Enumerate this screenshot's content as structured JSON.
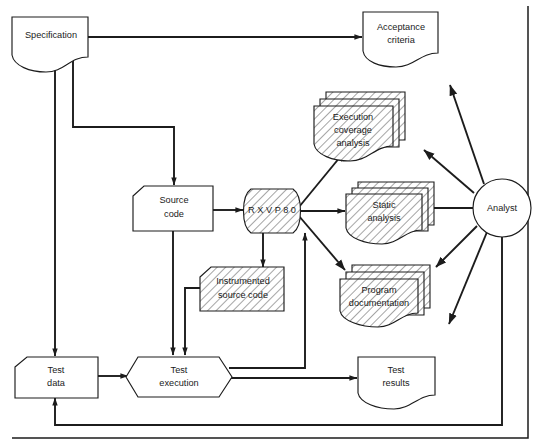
{
  "diagram": {
    "colors": {
      "stroke": "#1c1c1c",
      "background": "#ffffff",
      "hatch": "#2a2a2a"
    },
    "nodes": [
      {
        "id": "specification",
        "label": "Specification",
        "label_lines": [
          "Specification"
        ],
        "shape": "document",
        "hatched": false
      },
      {
        "id": "acceptance-criteria",
        "label": "Acceptance criteria",
        "label_lines": [
          "Acceptance",
          "criteria"
        ],
        "shape": "document",
        "hatched": false
      },
      {
        "id": "source-code",
        "label": "Source code",
        "label_lines": [
          "Source",
          "code"
        ],
        "shape": "notched-card",
        "hatched": false
      },
      {
        "id": "rxvp80",
        "label": "RXVP80",
        "label_lines": [
          "R X V P 8 0"
        ],
        "shape": "drum",
        "hatched": true
      },
      {
        "id": "execution-coverage-analysis",
        "label": "Execution coverage analysis",
        "label_lines": [
          "Execution",
          "coverage",
          "analysis"
        ],
        "shape": "document-stack",
        "hatched": true
      },
      {
        "id": "static-analysis",
        "label": "Static analysis",
        "label_lines": [
          "Static",
          "analysis"
        ],
        "shape": "document-stack",
        "hatched": true
      },
      {
        "id": "program-documentation",
        "label": "Program documentation",
        "label_lines": [
          "Program",
          "documentation"
        ],
        "shape": "document-stack",
        "hatched": true
      },
      {
        "id": "instrumented-source-code",
        "label": "Instrumented source code",
        "label_lines": [
          "Instrumented",
          "source code"
        ],
        "shape": "notched-card",
        "hatched": true
      },
      {
        "id": "test-data",
        "label": "Test data",
        "label_lines": [
          "Test",
          "data"
        ],
        "shape": "notched-card",
        "hatched": false
      },
      {
        "id": "test-execution",
        "label": "Test execution",
        "label_lines": [
          "Test",
          "execution"
        ],
        "shape": "hexagon",
        "hatched": false
      },
      {
        "id": "test-results",
        "label": "Test results",
        "label_lines": [
          "Test",
          "results"
        ],
        "shape": "document",
        "hatched": false
      },
      {
        "id": "analyst",
        "label": "Analyst",
        "label_lines": [
          "Analyst"
        ],
        "shape": "circle",
        "hatched": false
      }
    ],
    "edges": [
      {
        "id": "spec-to-acceptance",
        "from": "specification",
        "to": "acceptance-criteria",
        "arrow": true
      },
      {
        "id": "spec-to-source-code",
        "from": "specification",
        "to": "source-code",
        "arrow": true
      },
      {
        "id": "spec-to-test-data",
        "from": "specification",
        "to": "test-data",
        "arrow": true
      },
      {
        "id": "source-code-to-rxvp80",
        "from": "source-code",
        "to": "rxvp80",
        "arrow": true
      },
      {
        "id": "source-code-to-test-execution",
        "from": "source-code",
        "to": "test-execution",
        "arrow": true
      },
      {
        "id": "rxvp80-to-instrumented",
        "from": "rxvp80",
        "to": "instrumented-source-code",
        "arrow": true
      },
      {
        "id": "instrumented-to-test-execution",
        "from": "instrumented-source-code",
        "to": "test-execution",
        "arrow": true
      },
      {
        "id": "rxvp80-to-execution-coverage",
        "from": "rxvp80",
        "to": "execution-coverage-analysis",
        "arrow": true
      },
      {
        "id": "rxvp80-to-static-analysis",
        "from": "rxvp80",
        "to": "static-analysis",
        "arrow": true
      },
      {
        "id": "rxvp80-to-program-doc",
        "from": "rxvp80",
        "to": "program-documentation",
        "arrow": true
      },
      {
        "id": "test-data-to-test-execution",
        "from": "test-data",
        "to": "test-execution",
        "arrow": true
      },
      {
        "id": "test-execution-to-rxvp80",
        "from": "test-execution",
        "to": "rxvp80",
        "arrow": true
      },
      {
        "id": "test-execution-to-test-results",
        "from": "test-execution",
        "to": "test-results",
        "arrow": true
      },
      {
        "id": "analyst-to-execution-coverage",
        "from": "analyst",
        "to": "execution-coverage-analysis",
        "arrow": true
      },
      {
        "id": "analyst-to-static-analysis",
        "from": "analyst",
        "to": "static-analysis",
        "arrow": true
      },
      {
        "id": "analyst-to-program-doc",
        "from": "analyst",
        "to": "program-documentation",
        "arrow": true
      },
      {
        "id": "analyst-upper-output",
        "from": "analyst",
        "to": "upper-left",
        "arrow": true
      },
      {
        "id": "analyst-lower-output",
        "from": "analyst",
        "to": "lower-left",
        "arrow": true
      },
      {
        "id": "analyst-feedback-to-test-data",
        "from": "analyst",
        "to": "test-data",
        "arrow": true
      }
    ]
  }
}
